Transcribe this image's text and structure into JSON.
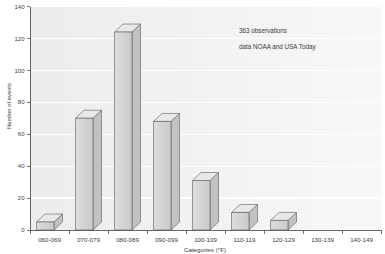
{
  "chart_data": {
    "type": "bar",
    "style": "3d-blocks",
    "title": "",
    "xlabel": "Categories (°F)",
    "ylabel": "Number of events",
    "categories": [
      "060-069",
      "070-079",
      "080-089",
      "090-099",
      "100-109",
      "110-119",
      "120-129",
      "130-139",
      "140-149"
    ],
    "values": [
      5,
      70,
      124,
      68,
      31,
      11,
      6,
      0,
      0
    ],
    "yticks": [
      0,
      20,
      40,
      60,
      80,
      100,
      120,
      140
    ],
    "ylim": [
      0,
      140
    ],
    "grid": "horizontal-white-lines-on-gray",
    "legend": "none",
    "annotations": [
      "363 observations",
      "data NOAA and USA Today"
    ],
    "colors": {
      "plot_bg_left": "#ececec",
      "plot_bg_right": "#f8f8f8",
      "gridline": "#ffffff",
      "bar_top": "#e8e8e8",
      "bar_front_light": "#dddddd",
      "bar_front_dark": "#cacaca",
      "bar_side": "#c2c2c2",
      "bar_stroke": "#5a5a5a",
      "axis": "#555555",
      "text": "#3a3a3a"
    }
  }
}
